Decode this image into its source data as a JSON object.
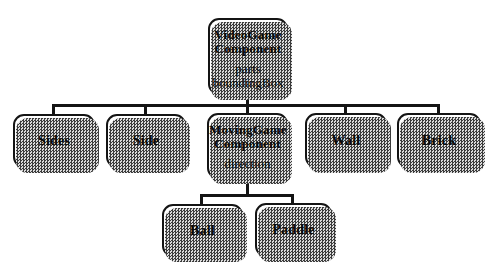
{
  "diagram_title": "VideoGame component class hierarchy",
  "colors": {
    "background": "#ffffff",
    "line": "#141414",
    "box_border": "#141414",
    "box_fill": "#ffffff",
    "text": "#0a0a0a",
    "shadow_dark": "#3c3c3c",
    "shadow_light": "#dcdcdc"
  },
  "nodes": {
    "videogame": {
      "title": [
        "VideoGame",
        "Component"
      ],
      "attrs": [
        "parts",
        "boundingBox"
      ]
    },
    "sides": {
      "title": [
        "Sides"
      ]
    },
    "side": {
      "title": [
        "Side"
      ]
    },
    "movinggame": {
      "title": [
        "MovingGame",
        "Component"
      ],
      "attrs": [
        "direction"
      ]
    },
    "wall": {
      "title": [
        "Wall"
      ]
    },
    "brick": {
      "title": [
        "Brick"
      ]
    },
    "ball": {
      "title": [
        "Ball"
      ]
    },
    "paddle": {
      "title": [
        "Paddle"
      ]
    }
  },
  "edges": [
    "VideoGameComponent->Sides",
    "VideoGameComponent->Side",
    "VideoGameComponent->MovingGameComponent",
    "VideoGameComponent->Wall",
    "VideoGameComponent->Brick",
    "MovingGameComponent->Ball",
    "MovingGameComponent->Paddle"
  ]
}
